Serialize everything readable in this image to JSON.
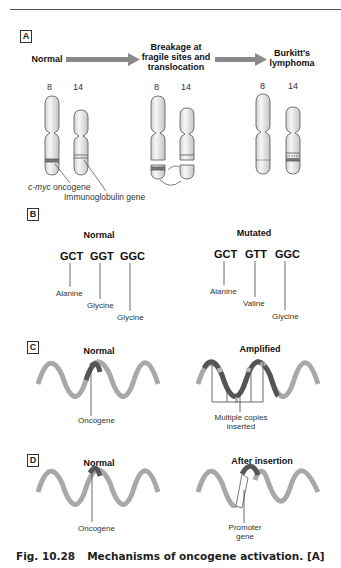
{
  "panels": {
    "A": {
      "label": "A",
      "stage_normal": "Normal",
      "stage_breakage": "Breakage at fragile sites and translocation",
      "stage_breakage_lines": [
        "Breakage at",
        "fragile sites and",
        "translocation"
      ],
      "stage_burkitt_lines": [
        "Burkitt's",
        "lymphoma"
      ],
      "chromosome_labels": [
        "8",
        "14"
      ],
      "annotation_cmyc": "c-myc oncogene",
      "annotation_cmyc_italic": "c-myc",
      "annotation_cmyc_rest": " oncogene",
      "annotation_ig": "Immunoglobulin gene"
    },
    "B": {
      "label": "B",
      "normal": {
        "title": "Normal",
        "codons": [
          "GCT",
          "GGT",
          "GGC"
        ],
        "amino_acids": [
          "Alanine",
          "Glycine",
          "Glycine"
        ]
      },
      "mutated": {
        "title": "Mutated",
        "codons": [
          "GCT",
          "GTT",
          "GGC"
        ],
        "amino_acids": [
          "Alanine",
          "Valine",
          "Glycine"
        ]
      }
    },
    "C": {
      "label": "C",
      "normal_title": "Normal",
      "normal_annotation": "Oncogene",
      "amplified_title": "Amplified",
      "amplified_annotation_lines": [
        "Multiple copies",
        "inserted"
      ]
    },
    "D": {
      "label": "D",
      "normal_title": "Normal",
      "normal_annotation": "Oncogene",
      "insertion_title": "After insertion",
      "insertion_annotation_lines": [
        "Promoter",
        "gene"
      ]
    }
  },
  "caption": {
    "number": "Fig. 10.28",
    "text": "Mechanisms of oncogene activation. [A]"
  },
  "colors": {
    "dna_strand": "#a8a8a8",
    "oncogene": "#555555",
    "arrow": "#8a8a8a",
    "chromosome_fill": "#eeeeee"
  }
}
